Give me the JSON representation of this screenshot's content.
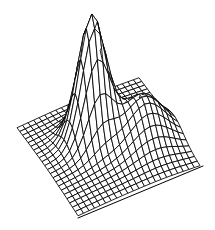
{
  "figure": {
    "title": "",
    "background_color": "#ffffff",
    "line_color": "#000000",
    "width": 215,
    "height": 230
  },
  "chart_data": {
    "type": "surface",
    "render_style": "wireframe-mesh",
    "title": "",
    "subtitle": "",
    "xlabel": "",
    "ylabel": "",
    "zlabel": "",
    "axes_visible": false,
    "tick_labels_visible": false,
    "legend": null,
    "grid": true,
    "annotations": [],
    "colors": {
      "line": "#000000",
      "face": "#ffffff",
      "background": "#ffffff",
      "baseline": "#000000"
    },
    "xlim": [
      -3.0,
      3.0
    ],
    "ylim": [
      -3.0,
      3.0
    ],
    "zlim": [
      0.0,
      1.0
    ],
    "x_tick_labels": [],
    "y_tick_labels": [],
    "z_tick_labels": [],
    "grid_nx": 22,
    "grid_ny": 22,
    "x": [
      -3.0,
      -2.7272,
      -2.4545,
      -2.1818,
      -1.9091,
      -1.6364,
      -1.3636,
      -1.0909,
      -0.8182,
      -0.5455,
      -0.2727,
      0.0,
      0.2727,
      0.5455,
      0.8182,
      1.0909,
      1.3636,
      1.6364,
      1.9091,
      2.1818,
      2.4545,
      2.7272,
      3.0
    ],
    "y": [
      -3.0,
      -2.7272,
      -2.4545,
      -2.1818,
      -1.9091,
      -1.6364,
      -1.3636,
      -1.0909,
      -0.8182,
      -0.5455,
      -0.2727,
      0.0,
      0.2727,
      0.5455,
      0.8182,
      1.0909,
      1.3636,
      1.6364,
      1.9091,
      2.1818,
      2.4545,
      2.7272,
      3.0
    ],
    "surface_function": {
      "description": "Sum of two gaussian-like peaks: a tall narrow main peak plus a smaller secondary ridge, over a near-flat plain.",
      "terms": [
        {
          "amplitude": 1.0,
          "cx": -0.55,
          "cy": 0.55,
          "sx": 0.62,
          "sy": 0.62
        },
        {
          "amplitude": 0.34,
          "cx": 1.45,
          "cy": -0.5,
          "sx": 0.95,
          "sy": 0.85
        },
        {
          "amplitude": 0.07,
          "cx": 0.0,
          "cy": 0.0,
          "sx": 2.6,
          "sy": 2.6
        }
      ]
    },
    "projection": {
      "type": "oblique-perspective",
      "azimuth_deg": -37.5,
      "elevation_deg": 22.0,
      "z_scale": 1.0
    },
    "features": [
      {
        "name": "main-peak",
        "screen_x": 77,
        "screen_y": 14,
        "height_norm": 1.0
      },
      {
        "name": "secondary-ridge",
        "screen_x": 150,
        "screen_y": 104,
        "height_norm": 0.34
      },
      {
        "name": "left-corner",
        "screen_x": 17,
        "screen_y": 130,
        "height_norm": 0.0
      },
      {
        "name": "front-corner",
        "screen_x": 78,
        "screen_y": 218,
        "height_norm": 0.0
      },
      {
        "name": "right-corner",
        "screen_x": 200,
        "screen_y": 168,
        "height_norm": 0.0
      }
    ],
    "baseline_segments": [
      {
        "name": "front-right-base-edge",
        "x1": 78,
        "y1": 218,
        "x2": 203,
        "y2": 166
      }
    ]
  }
}
